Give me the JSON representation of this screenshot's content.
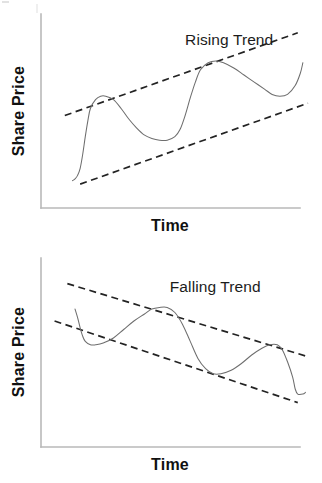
{
  "figure": {
    "background": "#ffffff",
    "stroke_colors": {
      "axis": "#b9b9b9",
      "trend_line": "#232323",
      "price_curve": "#6e6e6e",
      "text": "#111111"
    }
  },
  "panels": [
    {
      "id": "rising",
      "title": "Rising Trend",
      "xlabel": "Time",
      "ylabel": "Share Price"
    },
    {
      "id": "falling",
      "title": "Falling Trend",
      "xlabel": "Time",
      "ylabel": "Share Price"
    }
  ],
  "chart_data": [
    {
      "type": "line",
      "title": "Rising Trend",
      "xlabel": "Time",
      "ylabel": "Share Price",
      "axis_ticks": false,
      "grid": false,
      "legend": null,
      "xlim": [
        0,
        100
      ],
      "ylim": [
        0,
        100
      ],
      "axis_pixels": {
        "x0": 41,
        "y0": 208,
        "x1": 300,
        "y1": 14
      },
      "annotations": [
        {
          "text": "Rising Trend",
          "x": 52,
          "y": 88
        }
      ],
      "series": [
        {
          "name": "Share price path",
          "style": "solid",
          "color": "#6e6e6e",
          "points": [
            [
              8,
              11
            ],
            [
              9,
              12
            ],
            [
              10,
              14
            ],
            [
              11,
              18
            ],
            [
              12,
              26
            ],
            [
              13,
              36
            ],
            [
              14,
              45
            ],
            [
              15,
              52
            ],
            [
              17,
              57
            ],
            [
              19,
              59
            ],
            [
              21,
              59
            ],
            [
              24,
              57
            ],
            [
              27,
              52
            ],
            [
              30,
              46
            ],
            [
              33,
              41
            ],
            [
              36,
              37
            ],
            [
              39,
              35
            ],
            [
              42,
              34
            ],
            [
              45,
              34
            ],
            [
              48,
              36
            ],
            [
              50,
              40
            ],
            [
              52,
              48
            ],
            [
              54,
              58
            ],
            [
              56,
              67
            ],
            [
              58,
              74
            ],
            [
              61,
              78
            ],
            [
              64,
              79
            ],
            [
              67,
              78
            ],
            [
              71,
              75
            ],
            [
              75,
              71
            ],
            [
              79,
              67
            ],
            [
              83,
              63
            ],
            [
              86,
              60
            ],
            [
              89,
              59
            ],
            [
              92,
              60
            ],
            [
              95,
              65
            ],
            [
              97,
              72
            ],
            [
              98,
              78
            ]
          ]
        }
      ],
      "trend_lines": [
        {
          "name": "upper-resistance",
          "style": "dashed",
          "from": [
            5,
            48
          ],
          "to": [
            96,
            95
          ]
        },
        {
          "name": "lower-support",
          "style": "dashed",
          "from": [
            11,
            9
          ],
          "to": [
            100,
            55
          ]
        }
      ]
    },
    {
      "type": "line",
      "title": "Falling Trend",
      "xlabel": "Time",
      "ylabel": "Share Price",
      "axis_ticks": false,
      "grid": false,
      "legend": null,
      "xlim": [
        0,
        100
      ],
      "ylim": [
        0,
        100
      ],
      "axis_pixels": {
        "x0": 41,
        "y0": 447,
        "x1": 300,
        "y1": 258
      },
      "annotations": [
        {
          "text": "Falling Trend",
          "x": 46,
          "y": 87
        }
      ],
      "series": [
        {
          "name": "Share price path",
          "style": "solid",
          "color": "#6e6e6e",
          "points": [
            [
              9,
              77
            ],
            [
              10,
              72
            ],
            [
              11,
              66
            ],
            [
              12,
              61
            ],
            [
              13,
              58
            ],
            [
              15,
              56
            ],
            [
              17,
              56
            ],
            [
              20,
              57
            ],
            [
              24,
              60
            ],
            [
              28,
              65
            ],
            [
              32,
              70
            ],
            [
              36,
              74
            ],
            [
              39,
              77
            ],
            [
              42,
              78
            ],
            [
              45,
              78
            ],
            [
              48,
              75
            ],
            [
              51,
              68
            ],
            [
              54,
              58
            ],
            [
              57,
              48
            ],
            [
              60,
              42
            ],
            [
              63,
              39
            ],
            [
              66,
              39
            ],
            [
              70,
              41
            ],
            [
              74,
              45
            ],
            [
              78,
              50
            ],
            [
              82,
              54
            ],
            [
              85,
              56
            ],
            [
              88,
              56
            ],
            [
              90,
              53
            ],
            [
              92,
              46
            ],
            [
              94,
              37
            ],
            [
              95,
              30
            ],
            [
              96,
              27
            ],
            [
              98,
              27
            ],
            [
              99,
              28
            ]
          ]
        }
      ],
      "trend_lines": [
        {
          "name": "upper-resistance",
          "style": "dashed",
          "from": [
            6,
            92
          ],
          "to": [
            100,
            49
          ]
        },
        {
          "name": "lower-support",
          "style": "dashed",
          "from": [
            1,
            70
          ],
          "to": [
            96,
            22
          ]
        }
      ]
    }
  ]
}
